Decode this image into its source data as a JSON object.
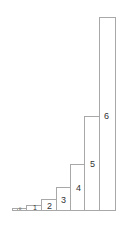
{
  "chart_data": {
    "type": "bar",
    "title": "",
    "xlabel": "",
    "ylabel": "",
    "grid": false,
    "legend": null,
    "categories": [
      "-2",
      "-1",
      "0",
      "1",
      "2",
      "3",
      "4",
      "5",
      "6"
    ],
    "values": [
      0.25,
      0.25,
      0.5,
      1,
      2,
      4,
      8,
      16,
      32
    ],
    "labels": [
      "",
      "",
      "0",
      "1",
      "2",
      "3",
      "4",
      "5",
      "6"
    ],
    "ylim": [
      0,
      33
    ]
  },
  "bars": [
    {
      "x": 12,
      "w": 5,
      "top": 208,
      "label": "",
      "lx": 0,
      "ly": 0,
      "size": "tiny"
    },
    {
      "x": 17,
      "w": 9,
      "top": 208,
      "label": "0",
      "lx": 19,
      "ly": 207,
      "size": "tiny"
    },
    {
      "x": 26,
      "w": 16,
      "top": 205,
      "label": "1",
      "lx": 33,
      "ly": 204,
      "size": "small"
    },
    {
      "x": 41,
      "w": 16,
      "top": 199,
      "label": "2",
      "lx": 47,
      "ly": 202,
      "size": ""
    },
    {
      "x": 56,
      "w": 15,
      "top": 187,
      "label": "3",
      "lx": 61,
      "ly": 196,
      "size": ""
    },
    {
      "x": 70,
      "w": 15,
      "top": 164,
      "label": "4",
      "lx": 76,
      "ly": 184,
      "size": ""
    },
    {
      "x": 84,
      "w": 16,
      "top": 116,
      "label": "5",
      "lx": 90,
      "ly": 160,
      "size": ""
    },
    {
      "x": 99,
      "w": 16,
      "top": 17,
      "label": "6",
      "lx": 104,
      "ly": 112,
      "size": ""
    }
  ],
  "baseline": 211,
  "colors": {
    "stroke": "#a8a8a8",
    "text": "#333333",
    "fill": "#ffffff"
  }
}
